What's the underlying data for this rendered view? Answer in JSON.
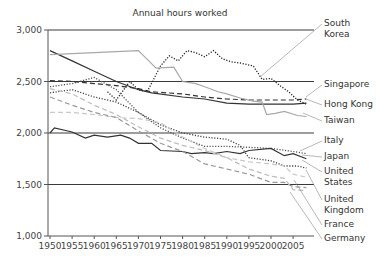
{
  "chart_data": {
    "type": "line",
    "title": "Annual hours worked",
    "xlabel": "",
    "ylabel": "",
    "ylim": [
      1000,
      3000
    ],
    "xlim": [
      1950,
      2009
    ],
    "y_ticks": [
      "1,000",
      "1,500",
      "2,000",
      "2,500",
      "3,000"
    ],
    "y_tick_values": [
      1000,
      1500,
      2000,
      2500,
      3000
    ],
    "x_ticks": [
      "1950",
      "1955",
      "1960",
      "1965",
      "1970",
      "1975",
      "1980",
      "1985",
      "1990",
      "1995",
      "2000",
      "2005"
    ],
    "grid": "horizontal",
    "legend_position": "right, direct labels",
    "series": [
      {
        "name": "South Korea",
        "label_lines": [
          "South",
          "Korea"
        ],
        "style": "dotted",
        "color": "#222222",
        "points": [
          [
            1963,
            2400
          ],
          [
            1965,
            2320
          ],
          [
            1968,
            2500
          ],
          [
            1970,
            2420
          ],
          [
            1972,
            2400
          ],
          [
            1975,
            2650
          ],
          [
            1977,
            2750
          ],
          [
            1979,
            2700
          ],
          [
            1981,
            2800
          ],
          [
            1983,
            2780
          ],
          [
            1985,
            2740
          ],
          [
            1987,
            2800
          ],
          [
            1989,
            2720
          ],
          [
            1991,
            2690
          ],
          [
            1993,
            2680
          ],
          [
            1996,
            2650
          ],
          [
            1998,
            2520
          ],
          [
            2000,
            2530
          ],
          [
            2002,
            2460
          ],
          [
            2004,
            2400
          ],
          [
            2006,
            2320
          ],
          [
            2008,
            2280
          ]
        ]
      },
      {
        "name": "Singapore",
        "label_lines": [
          "Singapore"
        ],
        "style": "dashed",
        "color": "#333333",
        "points": [
          [
            1950,
            2510
          ],
          [
            1955,
            2500
          ],
          [
            1960,
            2480
          ],
          [
            1965,
            2460
          ],
          [
            1970,
            2430
          ],
          [
            1973,
            2400
          ],
          [
            1980,
            2380
          ],
          [
            1985,
            2350
          ],
          [
            1990,
            2330
          ],
          [
            1995,
            2320
          ],
          [
            2000,
            2320
          ],
          [
            2005,
            2320
          ],
          [
            2008,
            2330
          ]
        ]
      },
      {
        "name": "Hong Kong",
        "label_lines": [
          "Hong Kong"
        ],
        "style": "solid",
        "color": "#333333",
        "points": [
          [
            1950,
            2800
          ],
          [
            1955,
            2700
          ],
          [
            1960,
            2600
          ],
          [
            1965,
            2500
          ],
          [
            1970,
            2420
          ],
          [
            1973,
            2390
          ],
          [
            1980,
            2350
          ],
          [
            1985,
            2330
          ],
          [
            1990,
            2290
          ],
          [
            1995,
            2280
          ],
          [
            2000,
            2280
          ],
          [
            2005,
            2280
          ],
          [
            2008,
            2290
          ]
        ]
      },
      {
        "name": "Taiwan",
        "label_lines": [
          "Taiwan"
        ],
        "style": "solid",
        "color": "#a8a8a8",
        "points": [
          [
            1950,
            2760
          ],
          [
            1960,
            2780
          ],
          [
            1970,
            2800
          ],
          [
            1974,
            2630
          ],
          [
            1978,
            2640
          ],
          [
            1980,
            2500
          ],
          [
            1983,
            2480
          ],
          [
            1985,
            2450
          ],
          [
            1988,
            2400
          ],
          [
            1990,
            2380
          ],
          [
            1993,
            2340
          ],
          [
            1996,
            2310
          ],
          [
            1998,
            2300
          ],
          [
            1999,
            2180
          ],
          [
            2001,
            2190
          ],
          [
            2003,
            2210
          ],
          [
            2006,
            2170
          ],
          [
            2008,
            2160
          ]
        ]
      },
      {
        "name": "Italy",
        "label_lines": [
          "Italy"
        ],
        "style": "dotted",
        "color": "#555555",
        "points": [
          [
            1950,
            2450
          ],
          [
            1955,
            2480
          ],
          [
            1960,
            2540
          ],
          [
            1965,
            2420
          ],
          [
            1970,
            2200
          ],
          [
            1975,
            2050
          ],
          [
            1980,
            1950
          ],
          [
            1985,
            1870
          ],
          [
            1990,
            1870
          ],
          [
            1995,
            1860
          ],
          [
            2000,
            1850
          ],
          [
            2005,
            1820
          ],
          [
            2008,
            1800
          ]
        ]
      },
      {
        "name": "Japan",
        "label_lines": [
          "Japan"
        ],
        "style": "solid",
        "color": "#333333",
        "points": [
          [
            1950,
            2000
          ],
          [
            1951,
            2050
          ],
          [
            1955,
            2010
          ],
          [
            1958,
            1950
          ],
          [
            1960,
            1980
          ],
          [
            1963,
            1960
          ],
          [
            1966,
            1980
          ],
          [
            1968,
            1950
          ],
          [
            1970,
            1900
          ],
          [
            1973,
            1900
          ],
          [
            1975,
            1830
          ],
          [
            1980,
            1820
          ],
          [
            1982,
            1800
          ],
          [
            1985,
            1810
          ],
          [
            1987,
            1800
          ],
          [
            1990,
            1820
          ],
          [
            1993,
            1800
          ],
          [
            1995,
            1830
          ],
          [
            2000,
            1850
          ],
          [
            2003,
            1780
          ],
          [
            2005,
            1800
          ],
          [
            2008,
            1750
          ]
        ]
      },
      {
        "name": "United States",
        "label_lines": [
          "United",
          "States"
        ],
        "style": "dotted",
        "color": "#444444",
        "points": [
          [
            1950,
            2390
          ],
          [
            1955,
            2420
          ],
          [
            1960,
            2350
          ],
          [
            1965,
            2300
          ],
          [
            1970,
            2200
          ],
          [
            1975,
            2080
          ],
          [
            1980,
            2000
          ],
          [
            1985,
            1960
          ],
          [
            1990,
            1940
          ],
          [
            1993,
            1880
          ],
          [
            1995,
            1760
          ],
          [
            2000,
            1730
          ],
          [
            2003,
            1680
          ],
          [
            2006,
            1680
          ],
          [
            2008,
            1660
          ]
        ]
      },
      {
        "name": "United Kingdom",
        "label_lines": [
          "United",
          "Kingdom"
        ],
        "style": "dashed",
        "color": "#c8c8c8",
        "points": [
          [
            1950,
            2200
          ],
          [
            1955,
            2200
          ],
          [
            1960,
            2180
          ],
          [
            1965,
            2150
          ],
          [
            1970,
            2140
          ],
          [
            1975,
            2100
          ],
          [
            1980,
            1960
          ],
          [
            1985,
            1850
          ],
          [
            1990,
            1760
          ],
          [
            1995,
            1720
          ],
          [
            2000,
            1700
          ],
          [
            2003,
            1680
          ],
          [
            2005,
            1600
          ],
          [
            2008,
            1570
          ]
        ]
      },
      {
        "name": "France",
        "label_lines": [
          "France"
        ],
        "style": "dashed",
        "color": "#999999",
        "points": [
          [
            1950,
            2350
          ],
          [
            1955,
            2270
          ],
          [
            1960,
            2200
          ],
          [
            1965,
            2150
          ],
          [
            1970,
            2020
          ],
          [
            1975,
            1900
          ],
          [
            1980,
            1820
          ],
          [
            1985,
            1700
          ],
          [
            1990,
            1650
          ],
          [
            1995,
            1600
          ],
          [
            2000,
            1520
          ],
          [
            2003,
            1520
          ],
          [
            2005,
            1480
          ],
          [
            2008,
            1470
          ]
        ]
      },
      {
        "name": "Germany",
        "label_lines": [
          "Germany"
        ],
        "style": "dashed",
        "color": "#bdbdbd",
        "points": [
          [
            1950,
            2430
          ],
          [
            1955,
            2380
          ],
          [
            1960,
            2270
          ],
          [
            1965,
            2180
          ],
          [
            1970,
            2060
          ],
          [
            1975,
            1950
          ],
          [
            1980,
            1880
          ],
          [
            1985,
            1830
          ],
          [
            1990,
            1760
          ],
          [
            1995,
            1650
          ],
          [
            2000,
            1580
          ],
          [
            2003,
            1560
          ],
          [
            2005,
            1450
          ],
          [
            2008,
            1440
          ]
        ]
      }
    ]
  }
}
